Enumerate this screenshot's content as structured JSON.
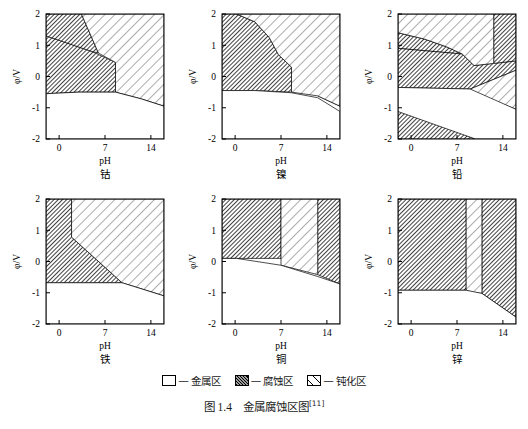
{
  "figure": {
    "caption_prefix": "图 1.4",
    "caption_text": "金属腐蚀区图",
    "caption_ref": "[11]"
  },
  "axes": {
    "x_title": "pH",
    "y_title": "φ/V",
    "x_ticks": [
      "0",
      "7",
      "14"
    ],
    "y_ticks": [
      "2",
      "1",
      "0",
      "-1",
      "-2"
    ],
    "x_range": [
      -2,
      16
    ],
    "y_range": [
      -2,
      2
    ]
  },
  "legend": {
    "items": [
      {
        "swatch": "metal",
        "dash": "—",
        "label": "金属区"
      },
      {
        "swatch": "corrosion",
        "dash": "—",
        "label": "腐蚀区"
      },
      {
        "swatch": "passive",
        "dash": "—",
        "label": "钝化区"
      }
    ]
  },
  "chart_data": {
    "type": "area",
    "title": "金属腐蚀区图",
    "xlabel": "pH",
    "ylabel": "φ/V",
    "xlim": [
      -2,
      16
    ],
    "ylim": [
      -2,
      2
    ],
    "x_ticks": [
      0,
      7,
      14
    ],
    "y_ticks": [
      2,
      1,
      0,
      -1,
      -2
    ],
    "grid": false,
    "legend_position": "bottom-center",
    "legend_entries": [
      "金属区",
      "腐蚀区",
      "钝化区"
    ],
    "zone_types": {
      "metal": "金属区",
      "corrosion": "腐蚀区",
      "passive": "钝化区"
    },
    "panels": [
      {
        "name": "钴",
        "element": "Co",
        "row": 0,
        "col": 0,
        "regions": [
          {
            "zone": "corrosion",
            "desc": "left acidic corrosion block",
            "polygon": [
              [
                -2,
                -0.55
              ],
              [
                -2,
                1.3
              ],
              [
                5.0,
                0.8
              ],
              [
                8.6,
                0.45
              ],
              [
                8.6,
                -0.5
              ],
              [
                3.0,
                -0.5
              ]
            ]
          },
          {
            "zone": "corrosion",
            "desc": "upper-left oxidizing corrosion wedge",
            "polygon": [
              [
                -2,
                1.3
              ],
              [
                -2,
                2
              ],
              [
                3.4,
                2
              ],
              [
                6.0,
                0.75
              ],
              [
                5.0,
                0.8
              ]
            ]
          },
          {
            "zone": "corrosion",
            "desc": "right alkaline corrosion block",
            "polygon": [
              [
                12.6,
                -0.72
              ],
              [
                12.6,
                0.12
              ],
              [
                16,
                0.12
              ],
              [
                16,
                -0.95
              ]
            ]
          },
          {
            "zone": "passive",
            "desc": "central/upper passivation field",
            "polygon": [
              [
                3.4,
                2
              ],
              [
                16,
                2
              ],
              [
                16,
                -0.95
              ],
              [
                12.6,
                -0.72
              ],
              [
                8.6,
                -0.5
              ],
              [
                8.6,
                0.45
              ],
              [
                6.0,
                0.75
              ]
            ]
          },
          {
            "zone": "metal",
            "desc": "lower immunity field",
            "polygon": [
              [
                -2,
                -0.55
              ],
              [
                3.0,
                -0.5
              ],
              [
                8.6,
                -0.5
              ],
              [
                12.6,
                -0.72
              ],
              [
                16,
                -0.95
              ],
              [
                16,
                -2
              ],
              [
                -2,
                -2
              ]
            ]
          }
        ]
      },
      {
        "name": "镍",
        "element": "Ni",
        "row": 0,
        "col": 1,
        "regions": [
          {
            "zone": "corrosion",
            "desc": "acidic corrosion block with curved right edge",
            "polygon": [
              [
                -2,
                -0.45
              ],
              [
                -2,
                0.2
              ],
              [
                -2,
                2
              ],
              [
                0.2,
                2
              ],
              [
                3.0,
                1.75
              ],
              [
                5.2,
                1.25
              ],
              [
                6.6,
                0.7
              ],
              [
                8.6,
                0.3
              ],
              [
                8.6,
                -0.5
              ],
              [
                3.0,
                -0.45
              ]
            ]
          },
          {
            "zone": "corrosion",
            "desc": "right alkaline corrosion block",
            "polygon": [
              [
                12.6,
                -0.62
              ],
              [
                12.6,
                0.28
              ],
              [
                16,
                0.28
              ],
              [
                16,
                -0.95
              ]
            ]
          },
          {
            "zone": "passive",
            "desc": "upper/right passivation field",
            "polygon": [
              [
                0.2,
                2
              ],
              [
                16,
                2
              ],
              [
                16,
                -0.95
              ],
              [
                12.6,
                -0.62
              ],
              [
                8.6,
                -0.5
              ],
              [
                8.6,
                0.3
              ],
              [
                6.6,
                0.7
              ],
              [
                5.2,
                1.25
              ],
              [
                3.0,
                1.75
              ]
            ]
          },
          {
            "zone": "metal",
            "desc": "lower immunity field",
            "polygon": [
              [
                -2,
                -0.45
              ],
              [
                3.0,
                -0.45
              ],
              [
                8.6,
                -0.52
              ],
              [
                12.6,
                -0.68
              ],
              [
                16,
                -1.12
              ],
              [
                16,
                -2
              ],
              [
                -2,
                -2
              ]
            ]
          }
        ]
      },
      {
        "name": "铅",
        "element": "Pb",
        "row": 0,
        "col": 2,
        "regions": [
          {
            "zone": "corrosion",
            "desc": "acid corrosion upper-left wedge",
            "polygon": [
              [
                -2,
                0.9
              ],
              [
                -2,
                1.4
              ],
              [
                2.0,
                1.2
              ],
              [
                5.4,
                0.95
              ],
              [
                7.8,
                0.72
              ]
            ]
          },
          {
            "zone": "corrosion",
            "desc": "acidic corrosion mid band",
            "polygon": [
              [
                -2,
                -0.35
              ],
              [
                -2,
                0.9
              ],
              [
                7.8,
                0.72
              ],
              [
                9.6,
                0.35
              ],
              [
                12.6,
                0.42
              ],
              [
                16,
                0.5
              ],
              [
                16,
                0.2
              ],
              [
                9.0,
                -0.4
              ]
            ]
          },
          {
            "zone": "corrosion",
            "desc": "right alkaline corrosion column",
            "polygon": [
              [
                12.6,
                0.42
              ],
              [
                12.6,
                2
              ],
              [
                16,
                2
              ],
              [
                16,
                0.5
              ]
            ]
          },
          {
            "zone": "corrosion",
            "desc": "bottom-left corrosion wedge",
            "polygon": [
              [
                -2,
                -1.12
              ],
              [
                -2,
                -2
              ],
              [
                9.8,
                -2
              ],
              [
                -0.2,
                -1.12
              ]
            ]
          },
          {
            "zone": "passive",
            "desc": "upper passivation field",
            "polygon": [
              [
                -2,
                1.4
              ],
              [
                -2,
                2
              ],
              [
                12.6,
                2
              ],
              [
                12.6,
                0.42
              ],
              [
                9.6,
                0.35
              ],
              [
                7.8,
                0.72
              ],
              [
                5.4,
                0.95
              ],
              [
                2.0,
                1.2
              ]
            ]
          },
          {
            "zone": "passive",
            "desc": "right lower passivation band",
            "polygon": [
              [
                9.0,
                -0.4
              ],
              [
                16,
                0.2
              ],
              [
                16,
                -1.05
              ],
              [
                9.6,
                -0.55
              ]
            ]
          },
          {
            "zone": "metal",
            "desc": "central immunity field",
            "polygon": [
              [
                -2,
                -0.35
              ],
              [
                9.0,
                -0.4
              ],
              [
                16,
                -1.05
              ],
              [
                16,
                -2
              ],
              [
                9.8,
                -2
              ],
              [
                -2,
                -1.12
              ]
            ]
          }
        ]
      },
      {
        "name": "铁",
        "element": "Fe",
        "row": 1,
        "col": 0,
        "regions": [
          {
            "zone": "corrosion",
            "desc": "acidic corrosion block left of pH≈1.9",
            "polygon": [
              [
                -2,
                -0.68
              ],
              [
                -2,
                2
              ],
              [
                1.9,
                2
              ],
              [
                1.9,
                0.78
              ],
              [
                9.6,
                -0.68
              ]
            ]
          },
          {
            "zone": "passive",
            "desc": "upper-right passivation field",
            "polygon": [
              [
                1.9,
                2
              ],
              [
                16,
                2
              ],
              [
                16,
                -1.1
              ],
              [
                9.6,
                -0.68
              ],
              [
                1.9,
                0.78
              ]
            ]
          },
          {
            "zone": "metal",
            "desc": "lower immunity field",
            "polygon": [
              [
                -2,
                -0.68
              ],
              [
                9.6,
                -0.68
              ],
              [
                16,
                -1.1
              ],
              [
                16,
                -2
              ],
              [
                -2,
                -2
              ]
            ]
          }
        ]
      },
      {
        "name": "铜",
        "element": "Cu",
        "row": 1,
        "col": 1,
        "regions": [
          {
            "zone": "corrosion",
            "desc": "acidic corrosion block left of pH 7",
            "polygon": [
              [
                -2,
                0.1
              ],
              [
                -2,
                2
              ],
              [
                7.0,
                2
              ],
              [
                7.0,
                0.1
              ],
              [
                0.2,
                0.1
              ]
            ]
          },
          {
            "zone": "corrosion",
            "desc": "alkaline corrosion column right of pH≈12.6",
            "polygon": [
              [
                12.6,
                -0.42
              ],
              [
                12.6,
                2
              ],
              [
                16,
                2
              ],
              [
                16,
                -0.72
              ]
            ]
          },
          {
            "zone": "passive",
            "desc": "central passivation column pH 7–12.6",
            "polygon": [
              [
                7.0,
                2
              ],
              [
                12.6,
                2
              ],
              [
                12.6,
                -0.42
              ],
              [
                7.0,
                -0.12
              ]
            ]
          },
          {
            "zone": "metal",
            "desc": "lower immunity field",
            "polygon": [
              [
                -2,
                0.1
              ],
              [
                0.2,
                0.1
              ],
              [
                7.0,
                -0.12
              ],
              [
                12.6,
                -0.48
              ],
              [
                16,
                -0.72
              ],
              [
                16,
                -2
              ],
              [
                -2,
                -2
              ]
            ]
          }
        ]
      },
      {
        "name": "锌",
        "element": "Zn",
        "row": 1,
        "col": 2,
        "regions": [
          {
            "zone": "corrosion",
            "desc": "acidic corrosion block left of pH≈8.4",
            "polygon": [
              [
                -2,
                -0.92
              ],
              [
                -2,
                2
              ],
              [
                8.4,
                2
              ],
              [
                8.4,
                -0.92
              ]
            ]
          },
          {
            "zone": "corrosion",
            "desc": "alkaline corrosion block right of pH≈10.8",
            "polygon": [
              [
                10.8,
                2
              ],
              [
                16,
                2
              ],
              [
                16,
                -1.78
              ],
              [
                10.8,
                -1.02
              ]
            ]
          },
          {
            "zone": "passive",
            "desc": "narrow passivation column pH 8.4–10.8",
            "polygon": [
              [
                8.4,
                2
              ],
              [
                10.8,
                2
              ],
              [
                10.8,
                -1.02
              ],
              [
                9.6,
                -1.0
              ],
              [
                8.4,
                -0.92
              ]
            ]
          },
          {
            "zone": "metal",
            "desc": "lower immunity field",
            "polygon": [
              [
                -2,
                -0.92
              ],
              [
                8.4,
                -0.92
              ],
              [
                10.8,
                -1.02
              ],
              [
                16,
                -1.78
              ],
              [
                16,
                -2
              ],
              [
                -2,
                -2
              ]
            ]
          }
        ]
      }
    ]
  }
}
